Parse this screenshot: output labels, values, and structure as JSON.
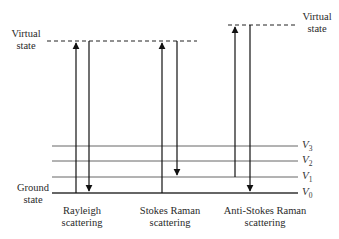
{
  "labels": {
    "virtual_state_left": [
      "Virtual",
      "state"
    ],
    "virtual_state_right": [
      "Virtual",
      "state"
    ],
    "ground_state": [
      "Ground",
      "state"
    ]
  },
  "levels": [
    {
      "name": "V",
      "sub": "3"
    },
    {
      "name": "V",
      "sub": "2"
    },
    {
      "name": "V",
      "sub": "1"
    },
    {
      "name": "V",
      "sub": "0"
    }
  ],
  "processes": [
    {
      "line1": "Rayleigh",
      "line2": "scattering"
    },
    {
      "line1": "Stokes Raman",
      "line2": "scattering"
    },
    {
      "line1": "Anti-Stokes Raman",
      "line2": "scattering"
    }
  ],
  "colors": {
    "line": "#1a1a1a",
    "level": "#555555"
  }
}
